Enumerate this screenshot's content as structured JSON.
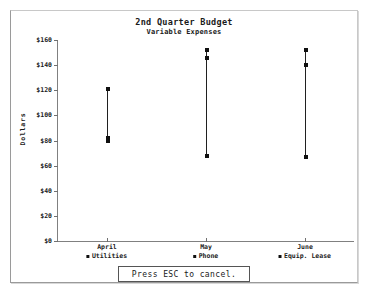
{
  "window": {
    "frame_color": "#9a9a9a",
    "background": "#ffffff"
  },
  "chart_data": {
    "type": "scatter",
    "title": "2nd Quarter Budget",
    "subtitle": "Variable Expenses",
    "xlabel": "",
    "ylabel": "Dollars",
    "ylim": [
      0,
      160
    ],
    "ytick_step": 20,
    "ytick_labels": [
      "$160",
      "$140",
      "$120",
      "$100",
      "$80",
      "$60",
      "$40",
      "$20",
      "$0"
    ],
    "ytick_values": [
      160,
      140,
      120,
      100,
      80,
      60,
      40,
      20,
      0
    ],
    "grid": false,
    "legend_position": "bottom",
    "categories": [
      "April",
      "May",
      "June"
    ],
    "series": [
      {
        "name": "Utilities",
        "marker": "square",
        "color": "#101010",
        "values": [
          80,
          68,
          67
        ]
      },
      {
        "name": "Phone",
        "marker": "square",
        "color": "#101010",
        "values": [
          82,
          146,
          140
        ]
      },
      {
        "name": "Equip. Lease",
        "marker": "square",
        "color": "#101010",
        "values": [
          121,
          152,
          152
        ]
      }
    ],
    "connector_ranges": [
      {
        "category": "April",
        "low": 79,
        "high": 121
      },
      {
        "category": "May",
        "low": 68,
        "high": 152
      },
      {
        "category": "June",
        "low": 67,
        "high": 152
      }
    ]
  },
  "footer": {
    "cancel_label": "Press ESC to cancel."
  }
}
